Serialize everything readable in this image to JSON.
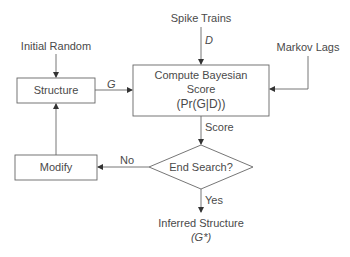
{
  "diagram": {
    "type": "flowchart",
    "title": "",
    "nodes": {
      "initial_random": {
        "label": "Initial Random"
      },
      "spike_trains": {
        "label": "Spike Trains"
      },
      "markov_lags": {
        "label": "Markov Lags"
      },
      "structure": {
        "label": "Structure"
      },
      "compute": {
        "line1": "Compute Bayesian",
        "line2": "Score",
        "line3": "(Pr(G|D))"
      },
      "end_search": {
        "label": "End Search?"
      },
      "modify": {
        "label": "Modify"
      },
      "inferred": {
        "line1": "Inferred Structure",
        "line2": "(G*)"
      }
    },
    "edges": {
      "initial_to_structure": {
        "label": ""
      },
      "structure_to_compute": {
        "label": "G"
      },
      "spike_to_compute": {
        "label": "D"
      },
      "markov_to_compute": {
        "label": ""
      },
      "compute_to_decision": {
        "label": "Score"
      },
      "decision_to_modify": {
        "label": "No"
      },
      "decision_to_inferred": {
        "label": "Yes"
      },
      "modify_to_structure": {
        "label": ""
      }
    },
    "colors": {
      "stroke": "#666666",
      "text": "#4a4a4a",
      "background": "#ffffff"
    }
  }
}
